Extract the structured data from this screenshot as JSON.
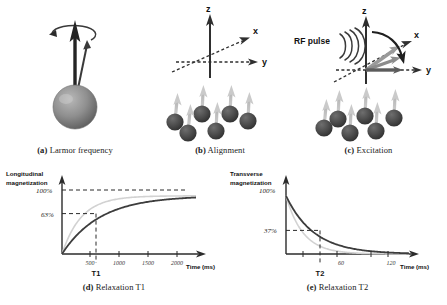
{
  "figure": {
    "panels": [
      {
        "id": "a",
        "tag": "(a)",
        "caption": "Larmor frequency"
      },
      {
        "id": "b",
        "tag": "(b)",
        "caption": "Alignment"
      },
      {
        "id": "c",
        "tag": "(c)",
        "caption": "Excitation"
      },
      {
        "id": "d",
        "tag": "(d)",
        "caption": "Relaxation T1"
      },
      {
        "id": "e",
        "tag": "(e)",
        "caption": "Relaxation T2"
      }
    ]
  },
  "panel_a": {
    "caption_tag": "(a)",
    "caption_text": "Larmor frequency",
    "description": "precessing spinning top with magnetic moment vector"
  },
  "panel_b": {
    "caption_tag": "(b)",
    "caption_text": "Alignment",
    "axis_z": "z",
    "axis_x": "x",
    "axis_y": "y",
    "spin_count": 6,
    "spin_direction": "up"
  },
  "panel_c": {
    "caption_tag": "(c)",
    "caption_text": "Excitation",
    "axis_z": "z",
    "axis_x": "x",
    "axis_y": "y",
    "rf_label": "RF pulse",
    "wave_arcs": 4,
    "spin_count": 6,
    "spin_direction": "up"
  },
  "chart_data": [
    {
      "type": "line",
      "panel": "d",
      "title": "Relaxation T1",
      "ylabel": "Longitudinal magnetization",
      "xlabel": "Time (ms)",
      "xticks": [
        500,
        1000,
        1500,
        2000
      ],
      "xlim": [
        0,
        2300
      ],
      "ylim": [
        0,
        110
      ],
      "ylabels": [
        "100%",
        "63%"
      ],
      "yvalues": [
        100,
        63
      ],
      "marker_label": "T1",
      "marker_x": 650,
      "grid": false,
      "series": [
        {
          "name": "T1 recovery (long)",
          "color": "#3d3d3d",
          "model": "100*(1-exp(-t/650))",
          "tau": 650,
          "x": [
            0,
            100,
            200,
            300,
            400,
            500,
            650,
            800,
            1000,
            1300,
            1600,
            2000,
            2300
          ],
          "values": [
            0,
            14.2,
            26.5,
            37.1,
            46.1,
            53.8,
            63.2,
            70.8,
            78.6,
            86.9,
            91.5,
            95.4,
            97.1
          ]
        },
        {
          "name": "T1 recovery (short, faint)",
          "color": "#cccccc",
          "model": "100*(1-exp(-t/330))",
          "tau": 330,
          "x": [
            0,
            100,
            200,
            330,
            500,
            700,
            900,
            1200,
            1600,
            2000,
            2300
          ],
          "values": [
            0,
            26.1,
            45.4,
            63.2,
            78.0,
            88.0,
            93.4,
            97.4,
            99.2,
            99.8,
            99.9
          ]
        }
      ],
      "annotations": [
        {
          "text": "100%",
          "type": "dashed-hline",
          "y": 100
        },
        {
          "text": "63%",
          "type": "dashed-hline",
          "y": 63
        },
        {
          "text": "T1",
          "type": "dashed-vline",
          "x": 650
        }
      ]
    },
    {
      "type": "line",
      "panel": "e",
      "title": "Relaxation T2",
      "ylabel": "Transverse magnetization",
      "xlabel": "Time (ms)",
      "xticks": [
        60,
        120
      ],
      "xlim": [
        0,
        145
      ],
      "ylim": [
        0,
        110
      ],
      "ylabels": [
        "100%",
        "37%"
      ],
      "yvalues": [
        100,
        37
      ],
      "marker_label": "T2",
      "marker_x": 33,
      "grid": false,
      "series": [
        {
          "name": "T2 decay (long)",
          "color": "#3d3d3d",
          "model": "100*exp(-t/33)",
          "tau": 33,
          "x": [
            0,
            5,
            10,
            20,
            33,
            45,
            60,
            80,
            100,
            120,
            145
          ],
          "values": [
            100,
            86.0,
            73.9,
            54.6,
            36.8,
            25.5,
            16.1,
            8.9,
            4.8,
            2.7,
            1.2
          ]
        },
        {
          "name": "T2 decay (short, faint)",
          "color": "#cccccc",
          "model": "100*exp(-t/20)",
          "tau": 20,
          "x": [
            0,
            5,
            10,
            20,
            30,
            45,
            60,
            80,
            100,
            120,
            145
          ],
          "values": [
            100,
            77.9,
            60.7,
            36.8,
            22.3,
            10.5,
            5.0,
            1.8,
            0.7,
            0.2,
            0.1
          ]
        }
      ],
      "annotations": [
        {
          "text": "100%",
          "type": "point",
          "y": 100
        },
        {
          "text": "37%",
          "type": "dashed-hline",
          "y": 37
        },
        {
          "text": "T2",
          "type": "dashed-vline",
          "x": 33
        }
      ]
    }
  ]
}
